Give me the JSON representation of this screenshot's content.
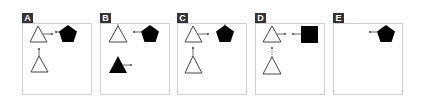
{
  "figure": {
    "panels": [
      {
        "label": "A",
        "left": 22
      },
      {
        "label": "B",
        "left": 100
      },
      {
        "label": "C",
        "left": 177
      },
      {
        "label": "D",
        "left": 255
      },
      {
        "label": "E",
        "left": 333
      }
    ],
    "colors": {
      "label_bg": "#333333",
      "label_text": "#ffffff",
      "panel_border": "#cfcfcf",
      "shape_fill": "#000000",
      "shape_outline": "#444444"
    }
  }
}
